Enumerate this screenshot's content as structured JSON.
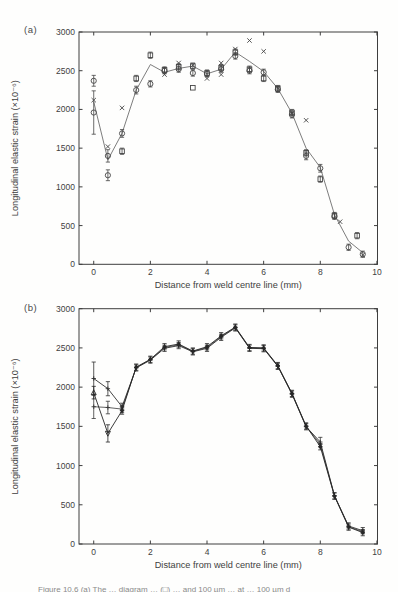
{
  "page": {
    "caption_fragment": "Figure 10.6 (a) The … diagram … (□) … and 100 µm … at … 100 µm d"
  },
  "chart_data": [
    {
      "id": "a",
      "panel_label": "(a)",
      "type": "line+scatter",
      "xlabel": "Distance from weld centre line (mm)",
      "ylabel": "Longitudinal elastic strain (×10⁻⁶)",
      "xlim": [
        -0.52,
        10.02
      ],
      "ylim": [
        0,
        3000
      ],
      "xticks": [
        0,
        2,
        4,
        6,
        8,
        10
      ],
      "yticks": [
        0,
        500,
        1000,
        1500,
        2000,
        2500,
        3000
      ],
      "grid": false,
      "legend": "none",
      "series": [
        {
          "name": "smoothed-profile-line",
          "type": "line",
          "marker": "none",
          "color": "#6e6e6e",
          "width": 0.9,
          "points": [
            [
              0,
              2100
            ],
            [
              0.5,
              1350
            ],
            [
              1,
              1690
            ],
            [
              1.5,
              2250
            ],
            [
              2,
              2580
            ],
            [
              2.5,
              2480
            ],
            [
              3,
              2530
            ],
            [
              3.5,
              2560
            ],
            [
              4,
              2460
            ],
            [
              4.5,
              2520
            ],
            [
              5,
              2740
            ],
            [
              5.5,
              2620
            ],
            [
              6,
              2490
            ],
            [
              6.5,
              2270
            ],
            [
              7,
              1950
            ],
            [
              7.5,
              1500
            ],
            [
              8,
              1250
            ],
            [
              8.5,
              640
            ],
            [
              9,
              300
            ],
            [
              9.5,
              150
            ]
          ]
        },
        {
          "name": "circle-markers",
          "type": "scatter",
          "marker": "circle",
          "color": "#454545",
          "points": [
            [
              0,
              2370,
              70
            ],
            [
              0,
              1960,
              280
            ],
            [
              0.5,
              1400,
              80
            ],
            [
              0.5,
              1150,
              70
            ],
            [
              1,
              1690,
              50
            ],
            [
              1.5,
              2250,
              50
            ],
            [
              2,
              2330,
              40
            ],
            [
              2.5,
              2500,
              40
            ],
            [
              3,
              2520,
              40
            ],
            [
              3.5,
              2470,
              40
            ],
            [
              4,
              2460,
              40
            ],
            [
              4.5,
              2520,
              40
            ],
            [
              5,
              2690,
              40
            ],
            [
              5.5,
              2500,
              40
            ],
            [
              6,
              2480,
              40
            ],
            [
              6.5,
              2260,
              40
            ],
            [
              7,
              1930,
              40
            ],
            [
              7.5,
              1400,
              50
            ],
            [
              8,
              1240,
              50
            ],
            [
              8.5,
              620,
              40
            ],
            [
              9,
              220,
              40
            ],
            [
              9.5,
              130,
              40
            ]
          ]
        },
        {
          "name": "square-markers",
          "type": "scatter",
          "marker": "square",
          "color": "#454545",
          "points": [
            [
              1,
              1460,
              40
            ],
            [
              1.5,
              2400,
              40
            ],
            [
              2,
              2700,
              40
            ],
            [
              2.5,
              2510,
              40
            ],
            [
              3,
              2550,
              40
            ],
            [
              3.5,
              2560,
              40
            ],
            [
              3.5,
              2280,
              0
            ],
            [
              4,
              2470,
              40
            ],
            [
              4.5,
              2540,
              40
            ],
            [
              5,
              2740,
              40
            ],
            [
              5.5,
              2520,
              40
            ],
            [
              6,
              2400,
              40
            ],
            [
              6.5,
              2270,
              40
            ],
            [
              7,
              1960,
              40
            ],
            [
              7.5,
              1440,
              40
            ],
            [
              8,
              1100,
              40
            ],
            [
              8.5,
              630,
              40
            ],
            [
              9.3,
              370,
              40
            ]
          ]
        },
        {
          "name": "cross-markers",
          "type": "scatter",
          "marker": "cross",
          "color": "#454545",
          "points": [
            [
              0,
              2120,
              0
            ],
            [
              0.5,
              1520,
              0
            ],
            [
              1,
              2020,
              0
            ],
            [
              2.5,
              2450,
              0
            ],
            [
              3,
              2600,
              0
            ],
            [
              3.5,
              2570,
              0
            ],
            [
              4,
              2400,
              0
            ],
            [
              4.5,
              2600,
              0
            ],
            [
              4.5,
              2450,
              0
            ],
            [
              5,
              2780,
              0
            ],
            [
              5.5,
              2890,
              0
            ],
            [
              6,
              2750,
              0
            ],
            [
              6.5,
              2280,
              0
            ],
            [
              7,
              1950,
              0
            ],
            [
              7.5,
              1860,
              0
            ],
            [
              8.7,
              550,
              0
            ],
            [
              9.5,
              120,
              0
            ]
          ]
        }
      ]
    },
    {
      "id": "b",
      "panel_label": "(b)",
      "type": "line+scatter",
      "xlabel": "Distance from weld centre line (mm)",
      "ylabel": "Longitudinal elastic strain (×10⁻⁶)",
      "xlim": [
        -0.52,
        10.02
      ],
      "ylim": [
        0,
        3000
      ],
      "xticks": [
        0,
        2,
        4,
        6,
        8,
        10
      ],
      "yticks": [
        0,
        500,
        1000,
        1500,
        2000,
        2500,
        3000
      ],
      "grid": false,
      "legend": "none",
      "series": [
        {
          "name": "strain-profile-lower",
          "type": "line",
          "marker": "plus",
          "color": "#3a3a3a",
          "width": 0.8,
          "points": [
            [
              0,
              1750,
              150
            ],
            [
              0.5,
              1740,
              80
            ],
            [
              1,
              1720,
              45
            ],
            [
              1.5,
              2250,
              0
            ],
            [
              2,
              2350,
              0
            ],
            [
              2.5,
              2505,
              0
            ],
            [
              3,
              2540,
              0
            ],
            [
              3.5,
              2455,
              0
            ],
            [
              4,
              2505,
              0
            ],
            [
              4.5,
              2645,
              0
            ],
            [
              5,
              2760,
              0
            ],
            [
              5.5,
              2500,
              0
            ],
            [
              6,
              2495,
              0
            ],
            [
              6.5,
              2270,
              0
            ],
            [
              7,
              1915,
              0
            ],
            [
              7.5,
              1500,
              0
            ],
            [
              8,
              1270,
              0
            ],
            [
              8.5,
              615,
              0
            ],
            [
              9,
              220,
              0
            ],
            [
              9.5,
              155,
              0
            ]
          ]
        },
        {
          "name": "strain-profile-upper",
          "type": "line",
          "marker": "plus",
          "color": "#303030",
          "width": 0.9,
          "points": [
            [
              0,
              2110,
              210
            ],
            [
              0.5,
              1980,
              90
            ],
            [
              1,
              1750,
              45
            ],
            [
              1.5,
              2245,
              40
            ],
            [
              2,
              2345,
              40
            ],
            [
              2.5,
              2495,
              40
            ],
            [
              3,
              2530,
              40
            ],
            [
              3.5,
              2450,
              40
            ],
            [
              4,
              2495,
              40
            ],
            [
              4.5,
              2635,
              40
            ],
            [
              5,
              2755,
              40
            ],
            [
              5.5,
              2495,
              40
            ],
            [
              6,
              2490,
              40
            ],
            [
              6.5,
              2265,
              40
            ],
            [
              7,
              1910,
              40
            ],
            [
              7.5,
              1495,
              40
            ],
            [
              8,
              1300,
              60
            ],
            [
              8.5,
              615,
              40
            ],
            [
              9,
              230,
              40
            ],
            [
              9.5,
              170,
              40
            ]
          ]
        },
        {
          "name": "strain-profile-middle",
          "type": "line",
          "marker": "plus",
          "color": "#262626",
          "width": 0.9,
          "blob_from": 2,
          "points": [
            [
              0,
              1930,
              80,
              "triu"
            ],
            [
              0.5,
              1410,
              110,
              "trid"
            ],
            [
              1,
              1700,
              45
            ],
            [
              1.5,
              2255,
              40
            ],
            [
              2,
              2355,
              40
            ],
            [
              2.5,
              2515,
              40
            ],
            [
              3,
              2550,
              40
            ],
            [
              3.5,
              2460,
              40
            ],
            [
              4,
              2515,
              40
            ],
            [
              4.5,
              2655,
              40
            ],
            [
              5,
              2765,
              40
            ],
            [
              5.5,
              2505,
              40
            ],
            [
              6,
              2500,
              40
            ],
            [
              6.5,
              2275,
              40
            ],
            [
              7,
              1920,
              40
            ],
            [
              7.5,
              1505,
              40
            ],
            [
              8,
              1240,
              40
            ],
            [
              8.5,
              610,
              40
            ],
            [
              9,
              215,
              40
            ],
            [
              9.5,
              145,
              40
            ]
          ]
        }
      ]
    }
  ]
}
